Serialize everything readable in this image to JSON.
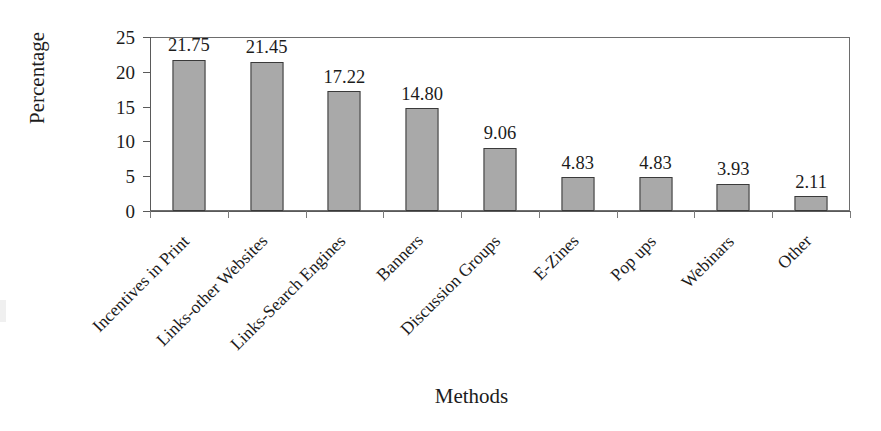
{
  "chart_data": {
    "type": "bar",
    "title": "",
    "xlabel": "Methods",
    "ylabel": "Percentage",
    "ylim": [
      0,
      25
    ],
    "ytick_step": 5,
    "yticks": [
      "25",
      "20",
      "15",
      "10",
      "5",
      "0"
    ],
    "grid": false,
    "legend": null,
    "bar_color": "#a9a9a9",
    "bar_edge_color": "#3a3a3a",
    "categories": [
      "Incentives in Print",
      "Links-other Websites",
      "Links-Search Engines",
      "Banners",
      "Discussion Groups",
      "E-Zines",
      "Pop ups",
      "Webinars",
      "Other"
    ],
    "values": [
      21.75,
      21.45,
      17.22,
      14.8,
      9.06,
      4.83,
      4.83,
      3.93,
      2.11
    ],
    "value_labels": [
      "21.75",
      "21.45",
      "17.22",
      "14.80",
      "9.06",
      "4.83",
      "4.83",
      "3.93",
      "2.11"
    ]
  }
}
